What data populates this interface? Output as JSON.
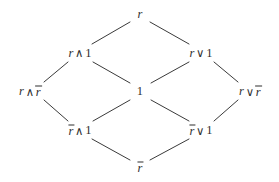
{
  "diagram": {
    "kind": "hasse-lattice-diagram",
    "title": "",
    "background_color": "#ffffff",
    "line_color": "#3a3a3a",
    "text_color": "#2f2f2f",
    "nodes": [
      {
        "id": "top",
        "label": "r",
        "x": 140,
        "y": 14,
        "parts": [
          {
            "type": "var",
            "text": "r"
          }
        ]
      },
      {
        "id": "r-and-1",
        "label": "r ∧ 1",
        "x": 80,
        "y": 53,
        "parts": [
          {
            "type": "var",
            "text": "r"
          },
          {
            "type": "op",
            "text": "∧"
          },
          {
            "type": "num",
            "text": "1"
          }
        ]
      },
      {
        "id": "r-or-1",
        "label": "r ∨ 1",
        "x": 201,
        "y": 53,
        "parts": [
          {
            "type": "var",
            "text": "r"
          },
          {
            "type": "op",
            "text": "∨"
          },
          {
            "type": "num",
            "text": "1"
          }
        ]
      },
      {
        "id": "r-and-rbar",
        "label": "r ∧ r̄",
        "x": 30,
        "y": 91,
        "parts": [
          {
            "type": "var",
            "text": "r"
          },
          {
            "type": "op",
            "text": "∧"
          },
          {
            "type": "neg",
            "text": "r"
          }
        ]
      },
      {
        "id": "one",
        "label": "1",
        "x": 140,
        "y": 91,
        "parts": [
          {
            "type": "num",
            "text": "1"
          }
        ]
      },
      {
        "id": "r-or-rbar",
        "label": "r ∨ r̄",
        "x": 250,
        "y": 91,
        "parts": [
          {
            "type": "var",
            "text": "r"
          },
          {
            "type": "op",
            "text": "∨"
          },
          {
            "type": "neg",
            "text": "r"
          }
        ]
      },
      {
        "id": "rbar-and-1",
        "label": "r̄ ∧ 1",
        "x": 80,
        "y": 130,
        "parts": [
          {
            "type": "neg",
            "text": "r"
          },
          {
            "type": "op",
            "text": "∧"
          },
          {
            "type": "num",
            "text": "1"
          }
        ]
      },
      {
        "id": "rbar-or-1",
        "label": "r̄ ∨ 1",
        "x": 201,
        "y": 130,
        "parts": [
          {
            "type": "neg",
            "text": "r"
          },
          {
            "type": "op",
            "text": "∨"
          },
          {
            "type": "num",
            "text": "1"
          }
        ]
      },
      {
        "id": "bottom",
        "label": "r̄",
        "x": 140,
        "y": 167,
        "parts": [
          {
            "type": "neg",
            "text": "r"
          }
        ]
      }
    ],
    "edges": [
      {
        "from": "r-and-1",
        "to": "top",
        "x1": 92,
        "y1": 44,
        "x2": 130,
        "y2": 22
      },
      {
        "from": "top",
        "to": "r-or-1",
        "x1": 150,
        "y1": 22,
        "x2": 189,
        "y2": 44
      },
      {
        "from": "r-and-rbar",
        "to": "r-and-1",
        "x1": 44,
        "y1": 82,
        "x2": 68,
        "y2": 62
      },
      {
        "from": "r-and-1",
        "to": "one",
        "x1": 93,
        "y1": 62,
        "x2": 130,
        "y2": 83
      },
      {
        "from": "one",
        "to": "r-or-1",
        "x1": 151,
        "y1": 83,
        "x2": 189,
        "y2": 62
      },
      {
        "from": "r-or-1",
        "to": "r-or-rbar",
        "x1": 214,
        "y1": 62,
        "x2": 238,
        "y2": 82
      },
      {
        "from": "r-and-rbar",
        "to": "rbar-and-1",
        "x1": 44,
        "y1": 100,
        "x2": 68,
        "y2": 121
      },
      {
        "from": "rbar-and-1",
        "to": "one",
        "x1": 93,
        "y1": 121,
        "x2": 130,
        "y2": 100
      },
      {
        "from": "one",
        "to": "rbar-or-1",
        "x1": 151,
        "y1": 100,
        "x2": 189,
        "y2": 121
      },
      {
        "from": "rbar-or-1",
        "to": "r-or-rbar",
        "x1": 214,
        "y1": 121,
        "x2": 238,
        "y2": 100
      },
      {
        "from": "rbar-and-1",
        "to": "bottom",
        "x1": 92,
        "y1": 139,
        "x2": 130,
        "y2": 160
      },
      {
        "from": "bottom",
        "to": "rbar-or-1",
        "x1": 150,
        "y1": 160,
        "x2": 189,
        "y2": 139
      }
    ]
  }
}
